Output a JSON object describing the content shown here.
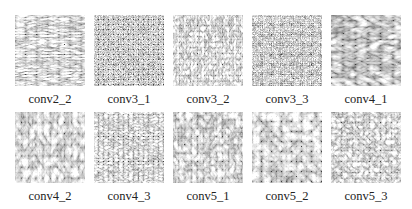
{
  "figure": {
    "top_cut_text": "",
    "panels": [
      {
        "label": "conv2_2",
        "row": 0,
        "col": 0,
        "freq": "0.09 0.35",
        "oct": 3,
        "seed": 3
      },
      {
        "label": "conv3_1",
        "row": 0,
        "col": 1,
        "freq": "0.6 0.6",
        "oct": 2,
        "seed": 7
      },
      {
        "label": "conv3_2",
        "row": 0,
        "col": 2,
        "freq": "0.28 0.18",
        "oct": 3,
        "seed": 11
      },
      {
        "label": "conv3_3",
        "row": 0,
        "col": 3,
        "freq": "0.45 0.45",
        "oct": 2,
        "seed": 5
      },
      {
        "label": "conv4_1",
        "row": 0,
        "col": 4,
        "freq": "0.08 0.16",
        "oct": 2,
        "seed": 21
      },
      {
        "label": "conv4_2",
        "row": 1,
        "col": 0,
        "freq": "0.14 0.09",
        "oct": 3,
        "seed": 9
      },
      {
        "label": "conv4_3",
        "row": 1,
        "col": 1,
        "freq": "0.2 0.32",
        "oct": 3,
        "seed": 13
      },
      {
        "label": "conv5_1",
        "row": 1,
        "col": 2,
        "freq": "0.16 0.12",
        "oct": 3,
        "seed": 17
      },
      {
        "label": "conv5_2",
        "row": 1,
        "col": 3,
        "freq": "0.1 0.1",
        "oct": 3,
        "seed": 29
      },
      {
        "label": "conv5_3",
        "row": 1,
        "col": 4,
        "freq": "0.18 0.18",
        "oct": 3,
        "seed": 31
      }
    ]
  }
}
